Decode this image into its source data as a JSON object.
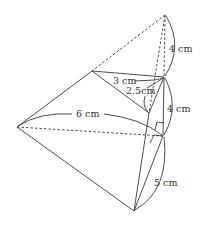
{
  "diagram": {
    "type": "3d-geometry-figure",
    "stroke_color": "#3a3a3a",
    "points": {
      "apex": [
        165,
        15
      ],
      "left": [
        17,
        127
      ],
      "inner_left": [
        92,
        71
      ],
      "right_mid": [
        164,
        77
      ],
      "inner_bottom": [
        149,
        113
      ],
      "right_foot": [
        163,
        136
      ],
      "bottom": [
        134,
        211
      ]
    },
    "labels": {
      "top_height": "4 cm",
      "mid_height": "4 cm",
      "inner_top": "3 cm",
      "inner_slant": "2.5cm",
      "left_length": "6 cm",
      "bottom_length": "5 cm"
    }
  }
}
